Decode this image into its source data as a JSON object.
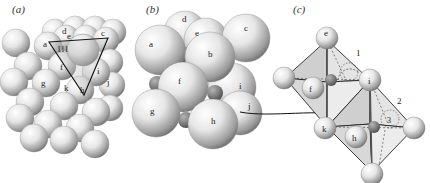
{
  "figure": {
    "panels": [
      {
        "id": "a",
        "label": "(a)"
      },
      {
        "id": "b",
        "label": "(b)"
      },
      {
        "id": "c",
        "label": "(c)"
      }
    ],
    "panel_a": {
      "plane_label": "111",
      "atom_labels": [
        "a",
        "c",
        "d",
        "e",
        "f",
        "g",
        "h",
        "i",
        "j",
        "k"
      ]
    },
    "panel_b": {
      "atom_labels": [
        "a",
        "b",
        "c",
        "d",
        "e",
        "f",
        "g",
        "h",
        "i",
        "j"
      ]
    },
    "panel_c": {
      "octahedra": [
        "1",
        "2"
      ],
      "vertex_labels": [
        "e",
        "f",
        "i",
        "k",
        "h"
      ],
      "rotation_label": "3"
    },
    "colors": {
      "sphere_light": "#f4f4f4",
      "sphere_shadow": "#8a8a8a",
      "interstitial": "#777777",
      "line": "#111111",
      "octahedron_fill": "#d8d8d8"
    }
  }
}
